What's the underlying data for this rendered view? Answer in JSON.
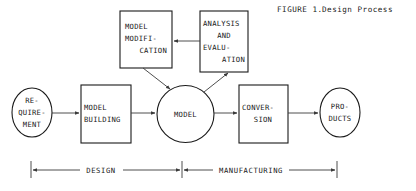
{
  "figure": {
    "caption_label": "FIGURE 1.",
    "caption_title": "Design Process"
  },
  "nodes": {
    "requirement": {
      "shape": "ellipse",
      "lines": [
        "RE-",
        "QUIRE-",
        "MENT"
      ]
    },
    "model_building": {
      "shape": "rect",
      "lines": [
        "MODEL",
        "BUILDING"
      ]
    },
    "model": {
      "shape": "circle",
      "lines": [
        "MODEL"
      ]
    },
    "conversion": {
      "shape": "rect",
      "lines": [
        "CONVER-",
        "SION"
      ]
    },
    "products": {
      "shape": "ellipse",
      "lines": [
        "PRO-",
        "DUCTS"
      ]
    },
    "model_modification": {
      "shape": "rect",
      "lines": [
        "MODEL",
        "MODIFI-",
        "CATION"
      ]
    },
    "analysis_and_evaluation": {
      "shape": "rect",
      "lines": [
        "ANALYSIS",
        "AND",
        "EVALU-",
        "ATION"
      ]
    }
  },
  "spans": {
    "design_label": "DESIGN",
    "manufacturing_label": "MANUFACTURING"
  },
  "colors": {
    "ink": "#1a1a1a",
    "connector": "#3a3a3a",
    "paper": "#ffffff"
  }
}
